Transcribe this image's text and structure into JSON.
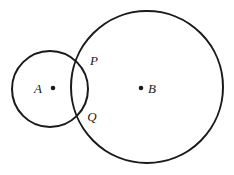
{
  "figure": {
    "background_color": "#ffffff",
    "stroke_color": "#1a1a1a",
    "width": 234,
    "height": 175
  },
  "chart_data": {
    "type": "diagram",
    "title": "",
    "subtitle": "",
    "xlabel": "",
    "ylabel": "",
    "grid": false,
    "legend": null,
    "shapes": [
      {
        "kind": "circle",
        "name": "circle-a",
        "center_label": "A",
        "cx": 50,
        "cy": 89,
        "r": 38,
        "stroke": "#1a1a1a",
        "stroke_width": 2,
        "fill": "none"
      },
      {
        "kind": "circle",
        "name": "circle-b",
        "center_label": "B",
        "cx": 147,
        "cy": 87,
        "r": 76,
        "stroke": "#1a1a1a",
        "stroke_width": 2,
        "fill": "none"
      }
    ],
    "points": [
      {
        "name": "center-a",
        "label": "A",
        "x": 53,
        "y": 88,
        "marked": true
      },
      {
        "name": "center-b",
        "label": "B",
        "x": 141,
        "y": 88,
        "marked": true
      },
      {
        "name": "intersection-upper",
        "label": "P",
        "x": 83,
        "y": 62,
        "marked": false
      },
      {
        "name": "intersection-lower",
        "label": "Q",
        "x": 83,
        "y": 115,
        "marked": false
      }
    ]
  },
  "labels": {
    "circle_a_center": "A",
    "circle_b_center": "B",
    "intersection_upper": "P",
    "intersection_lower": "Q"
  },
  "label_positions": {
    "a": {
      "x": 38,
      "y": 93,
      "size": 13
    },
    "b": {
      "x": 148,
      "y": 93,
      "size": 13
    },
    "p": {
      "x": 90,
      "y": 65,
      "size": 13
    },
    "q": {
      "x": 88,
      "y": 121,
      "size": 13
    }
  },
  "dots": {
    "a": {
      "x": 53,
      "y": 88,
      "r": 2.3
    },
    "b": {
      "x": 141,
      "y": 88,
      "r": 2.3
    }
  }
}
